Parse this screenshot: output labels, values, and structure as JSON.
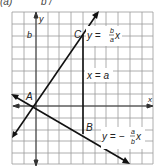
{
  "caption": {
    "prefix": "(a)",
    "fragment": "b /"
  },
  "diagram": {
    "type": "coordinate-plane",
    "grid": {
      "left": 12,
      "top": 12,
      "right": 153,
      "bottom": 164,
      "cell": 11.75,
      "color": "#9a9a9a"
    },
    "axes": {
      "x_label": "x",
      "y_label": "y",
      "y_tick_label": "b"
    },
    "points": [
      {
        "name": "A",
        "label": "A"
      },
      {
        "name": "B",
        "label": "B"
      },
      {
        "name": "C",
        "label": "C"
      }
    ],
    "lines": [
      {
        "name": "line-y-b-over-a-x",
        "eq_prefix": "y =",
        "num": "b",
        "den": "a",
        "var": "x"
      },
      {
        "name": "line-x-equals-a",
        "label": "x = a"
      },
      {
        "name": "line-y-neg-a-over-b-x",
        "eq_prefix": "y = −",
        "num": "a",
        "den": "b",
        "var": "x"
      }
    ]
  }
}
